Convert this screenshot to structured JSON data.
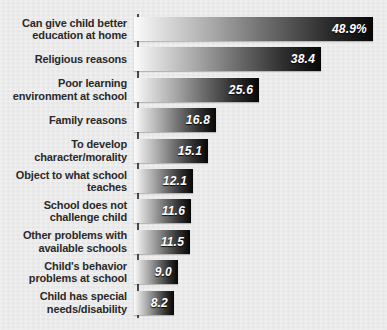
{
  "chart_data": {
    "type": "bar",
    "orientation": "horizontal",
    "title": "",
    "subtitle": "",
    "xlabel": "",
    "ylabel": "",
    "grid": false,
    "legend": null,
    "xlim": [
      0,
      49
    ],
    "categories": [
      "Can give child better\neducation at home",
      "Religious reasons",
      "Poor learning\nenvironment at school",
      "Family reasons",
      "To develop\ncharacter/morality",
      "Object to what school\nteaches",
      "School does not\nchallenge child",
      "Other problems with\navailable schools",
      "Child's behavior\nproblems at school",
      "Child has special\nneeds/disability"
    ],
    "values": [
      48.9,
      38.4,
      25.6,
      16.8,
      15.1,
      12.1,
      11.6,
      11.5,
      9.0,
      8.2
    ],
    "value_labels": [
      "48.9%",
      "38.4",
      "25.6",
      "16.8",
      "15.1",
      "12.1",
      "11.6",
      "11.5",
      "9.0",
      "8.2"
    ]
  },
  "style": {
    "background_color": "#e9e9e9",
    "axis_color": "#4a4a4a",
    "label_color": "#2a2a2a",
    "value_color": "#ffffff",
    "bar_gradient_start": "#fbfbfb",
    "bar_gradient_end": "#070707"
  }
}
